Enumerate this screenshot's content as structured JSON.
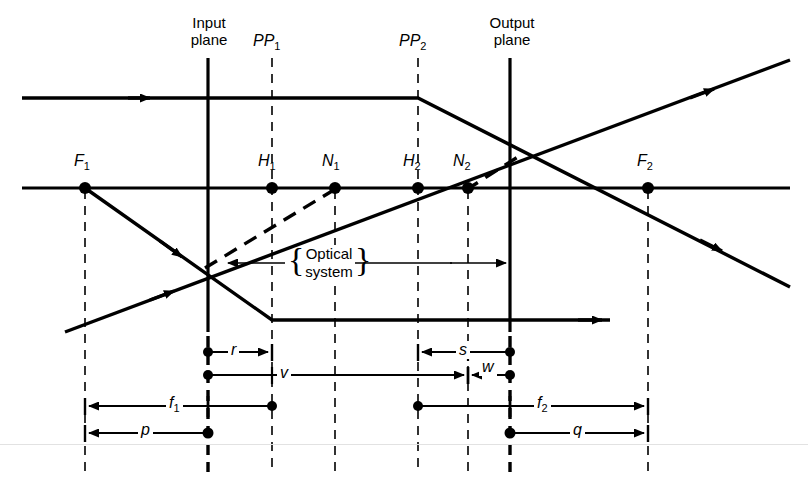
{
  "figure": {
    "type": "optical-ray-diagram",
    "ink_color": "#000000",
    "background_color": "#ffffff"
  },
  "plane_labels": {
    "input_plane_line1": "Input",
    "input_plane_line2": "plane",
    "pp1": "PP",
    "pp1_sub": "1",
    "pp2": "PP",
    "pp2_sub": "2",
    "output_plane_line1": "Output",
    "output_plane_line2": "plane"
  },
  "axis_points": [
    {
      "name": "F1",
      "symbol": "F",
      "sub": "1",
      "x": 85,
      "y": 188
    },
    {
      "name": "H1",
      "symbol": "H",
      "sub": "1",
      "x": 272,
      "y": 188
    },
    {
      "name": "N1",
      "symbol": "N",
      "sub": "1",
      "x": 335,
      "y": 188
    },
    {
      "name": "H2",
      "symbol": "H",
      "sub": "2",
      "x": 418,
      "y": 188
    },
    {
      "name": "N2",
      "symbol": "N",
      "sub": "2",
      "x": 468,
      "y": 188
    },
    {
      "name": "F2",
      "symbol": "F",
      "sub": "2",
      "x": 648,
      "y": 188
    }
  ],
  "optical_system_label": {
    "line1": "Optical",
    "line2": "system",
    "left_brace": "{",
    "right_brace": "}"
  },
  "dimensions": [
    {
      "name": "r",
      "symbol": "r",
      "sub": "",
      "from_x": 208,
      "to_x": 272,
      "y": 352,
      "direction": "right"
    },
    {
      "name": "v",
      "symbol": "v",
      "sub": "",
      "from_x": 208,
      "to_x": 468,
      "y": 375,
      "direction": "right"
    },
    {
      "name": "s",
      "symbol": "s",
      "sub": "",
      "from_x": 510,
      "to_x": 418,
      "y": 352,
      "direction": "left"
    },
    {
      "name": "w",
      "symbol": "w",
      "sub": "",
      "from_x": 510,
      "to_x": 468,
      "y": 375,
      "direction": "left"
    },
    {
      "name": "f1",
      "symbol": "f",
      "sub": "1",
      "from_x": 272,
      "to_x": 85,
      "y": 406,
      "direction": "left"
    },
    {
      "name": "f2",
      "symbol": "f",
      "sub": "2",
      "from_x": 418,
      "to_x": 648,
      "y": 406,
      "direction": "right"
    },
    {
      "name": "p",
      "symbol": "p",
      "sub": "",
      "from_x": 208,
      "to_x": 85,
      "y": 433,
      "direction": "left"
    },
    {
      "name": "q",
      "symbol": "q",
      "sub": "",
      "from_x": 510,
      "to_x": 648,
      "y": 433,
      "direction": "right"
    }
  ],
  "vertical_lines": [
    {
      "name": "F1-line",
      "x": 85,
      "style": "dashed",
      "weight": "thin",
      "top": 190,
      "bottom": 472
    },
    {
      "name": "input-plane",
      "x": 208,
      "style": "solid",
      "weight": "thick",
      "top": 58,
      "bottom": 330
    },
    {
      "name": "input-plane-dash",
      "x": 208,
      "style": "dashed",
      "weight": "thick",
      "top": 330,
      "bottom": 472
    },
    {
      "name": "PP1-line",
      "x": 272,
      "style": "dashed",
      "weight": "thin",
      "top": 58,
      "bottom": 472
    },
    {
      "name": "N1-line",
      "x": 335,
      "style": "dashed",
      "weight": "thin",
      "top": 190,
      "bottom": 472
    },
    {
      "name": "PP2-line",
      "x": 418,
      "style": "dashed",
      "weight": "thin",
      "top": 58,
      "bottom": 472
    },
    {
      "name": "N2-line",
      "x": 468,
      "style": "dashed",
      "weight": "thin",
      "top": 190,
      "bottom": 472
    },
    {
      "name": "output-plane",
      "x": 510,
      "style": "solid",
      "weight": "thick",
      "top": 58,
      "bottom": 330
    },
    {
      "name": "output-plane-dash",
      "x": 510,
      "style": "dashed",
      "weight": "thick",
      "top": 330,
      "bottom": 472
    },
    {
      "name": "F2-line",
      "x": 648,
      "style": "dashed",
      "weight": "thin",
      "top": 190,
      "bottom": 472
    }
  ],
  "rays": {
    "optical_axis": {
      "name": "optical-axis",
      "y": 188,
      "from_x": 22,
      "to_x": 790
    },
    "upper_ray": {
      "name": "upper-parallel-ray",
      "points": "22,98 418,98 790,285",
      "arrow_at": "145,98"
    },
    "lower_ray": {
      "name": "lower-output-ray",
      "points": "272,320 610,320",
      "arrow_at": "600,320"
    },
    "f1_ray": {
      "name": "f1-through-ray",
      "points": "85,188 300,325 790,225"
    },
    "up_ray": {
      "name": "lower-input-ray",
      "points": "65,332 790,60"
    },
    "dashed_ray": {
      "name": "nodal-dashed-ray-1",
      "points": "208,266 335,188"
    },
    "dashed_ray2": {
      "name": "nodal-dashed-ray-2",
      "points": "468,188 520,155"
    }
  }
}
